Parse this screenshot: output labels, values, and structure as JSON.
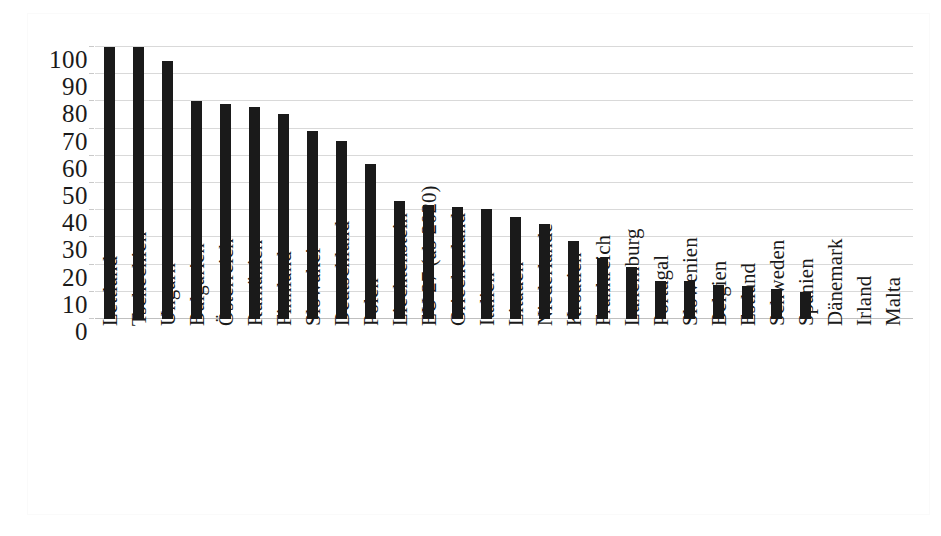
{
  "chart_data": {
    "type": "bar",
    "title": "",
    "subtitle": "",
    "xlabel": "",
    "ylabel": "",
    "ylim": [
      0,
      100
    ],
    "yticks": [
      0,
      10,
      20,
      30,
      40,
      50,
      60,
      70,
      80,
      90,
      100
    ],
    "grid": true,
    "legend": "none",
    "bar_color": "#1a1a1a",
    "gridline_color": "#d9d9d9",
    "background_color": "#ffffff",
    "categories": [
      "Lettland",
      "Tschechien",
      "Ungarn",
      "Bulgarien",
      "Österreich",
      "Rumänien",
      "Finnland",
      "Slowakei",
      "Deutschland",
      "Polen",
      "Liechtenstein",
      "EU 27 (ab 2020)",
      "Griechenland",
      "Italien",
      "Litauen",
      "Niederlande",
      "Kroatien",
      "Frankreich",
      "Luxemburg",
      "Portugal",
      "Slowenien",
      "Belgien",
      "Estland",
      "Schweden",
      "Spanien",
      "Dänemark",
      "Irland",
      "Malta"
    ],
    "values": [
      100,
      100,
      95,
      80,
      79,
      78,
      75.5,
      69,
      65.5,
      57,
      43.5,
      42,
      41,
      40.5,
      37.5,
      35,
      28.5,
      22.5,
      19,
      14,
      14,
      12.5,
      12,
      11,
      10,
      0,
      0,
      0
    ]
  }
}
